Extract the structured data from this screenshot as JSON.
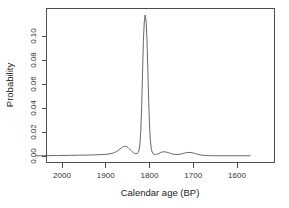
{
  "chart_data": {
    "type": "line",
    "title": "",
    "xlabel": "Calendar age (BP)",
    "ylabel": "Probability",
    "xlim": [
      2060,
      1570
    ],
    "ylim": [
      -0.004,
      0.1185
    ],
    "x_reversed": true,
    "grid": false,
    "legend": "none",
    "xticks": [
      2000,
      1900,
      1800,
      1700,
      1600
    ],
    "xticklabels": [
      "2000",
      "1900",
      "1800",
      "1700",
      "1600"
    ],
    "yticks": [
      0.0,
      0.02,
      0.04,
      0.06,
      0.08,
      0.1
    ],
    "yticklabels": [
      "0.00",
      "0.02",
      "0.04",
      "0.06",
      "0.08",
      "0.10"
    ],
    "series": [
      {
        "name": "Calibrated age probability density",
        "x": [
          2060,
          2050,
          2040,
          2030,
          2020,
          2010,
          2000,
          1990,
          1980,
          1970,
          1960,
          1950,
          1940,
          1930,
          1920,
          1910,
          1900,
          1895,
          1890,
          1885,
          1880,
          1875,
          1870,
          1867,
          1864,
          1861,
          1858,
          1855,
          1852,
          1849,
          1846,
          1843,
          1840,
          1837,
          1834,
          1831,
          1828,
          1826,
          1824,
          1822,
          1820,
          1818,
          1816,
          1814,
          1812,
          1810,
          1808,
          1806,
          1804,
          1802,
          1800,
          1798,
          1796,
          1794,
          1792,
          1790,
          1788,
          1786,
          1784,
          1782,
          1780,
          1778,
          1776,
          1774,
          1772,
          1770,
          1766,
          1762,
          1758,
          1754,
          1750,
          1745,
          1740,
          1735,
          1730,
          1725,
          1720,
          1715,
          1710,
          1705,
          1700,
          1695,
          1690,
          1685,
          1680,
          1675,
          1670,
          1665,
          1660,
          1655,
          1650,
          1645,
          1640,
          1630,
          1620,
          1610,
          1600,
          1590,
          1580,
          1570
        ],
        "y": [
          0.0002,
          0.0002,
          0.0003,
          0.0003,
          0.0004,
          0.0004,
          0.0005,
          0.0005,
          0.0006,
          0.0006,
          0.0007,
          0.0007,
          0.0008,
          0.0009,
          0.001,
          0.0012,
          0.0014,
          0.0016,
          0.0019,
          0.0023,
          0.0029,
          0.0038,
          0.0051,
          0.006,
          0.0069,
          0.0076,
          0.008,
          0.0081,
          0.0078,
          0.0071,
          0.006,
          0.0048,
          0.0037,
          0.0028,
          0.0022,
          0.0019,
          0.0021,
          0.0028,
          0.0048,
          0.0095,
          0.0205,
          0.0405,
          0.0685,
          0.0955,
          0.1115,
          0.1175,
          0.1135,
          0.0985,
          0.0745,
          0.0475,
          0.0258,
          0.0128,
          0.0062,
          0.0033,
          0.002,
          0.0015,
          0.0013,
          0.0013,
          0.0014,
          0.0016,
          0.0019,
          0.0022,
          0.0026,
          0.0029,
          0.0032,
          0.0034,
          0.0035,
          0.0033,
          0.0029,
          0.0024,
          0.0019,
          0.0015,
          0.0013,
          0.0013,
          0.0015,
          0.0019,
          0.0024,
          0.0028,
          0.003,
          0.0029,
          0.0025,
          0.0019,
          0.0014,
          0.001,
          0.0007,
          0.0005,
          0.0004,
          0.0003,
          0.0003,
          0.0002,
          0.0002,
          0.0002,
          0.0002,
          0.0002,
          0.0002,
          0.0002,
          0.0002,
          0.0002,
          0.0002,
          0.0002
        ]
      }
    ],
    "annotations": {
      "main_peak_x": 1810,
      "main_peak_y": 0.1175,
      "secondary_peak_x": 1855,
      "secondary_peak_y": 0.0081
    }
  },
  "axes": {
    "x_axis_title": "Calendar age (BP)",
    "y_axis_title": "Probability"
  }
}
